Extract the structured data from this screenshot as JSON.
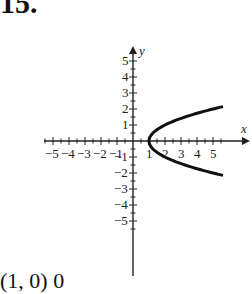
{
  "problem": {
    "number": "15.",
    "footer_text": "(1, 0)        0"
  },
  "chart_data": {
    "type": "line",
    "title": "",
    "xlabel": "x",
    "ylabel": "y",
    "xlim": [
      -5.5,
      5.5
    ],
    "ylim": [
      -5.5,
      5.5
    ],
    "x_ticks": [
      -5,
      -4,
      -3,
      -2,
      -1,
      1,
      2,
      3,
      4,
      5
    ],
    "y_ticks": [
      -5,
      -4,
      -3,
      -2,
      -1,
      1,
      2,
      3,
      4,
      5
    ],
    "grid": false,
    "series": [
      {
        "name": "x = y^2 + 1",
        "x": [
          5.5,
          5,
          3.25,
          2,
          1.25,
          1,
          1.25,
          2,
          3.25,
          5,
          5.5
        ],
        "y": [
          -2.12,
          -2,
          -1.5,
          -1,
          -0.5,
          0,
          0.5,
          1,
          1.5,
          2,
          2.12
        ]
      }
    ],
    "annotations": [
      "vertex (1, 0)"
    ]
  }
}
